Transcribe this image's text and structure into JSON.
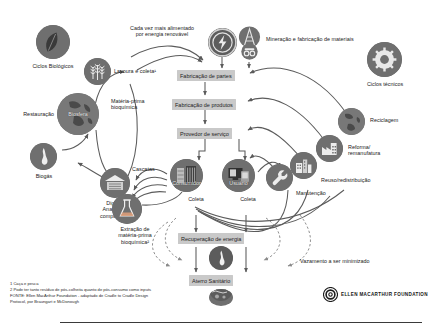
{
  "diagram": {
    "palette": {
      "node_fill": "#6f6f6f",
      "node_fill_dark": "#4f4f4f",
      "box_fill": "#c9c9c9",
      "line": "#5b5b5b",
      "text": "#1c1c1c",
      "background": "#ffffff"
    }
  },
  "annotations": {
    "renewable_energy": "Cada vez mais alimentado\npor energia renovável",
    "mining": "Mineração e fabricação de materiais",
    "farming": "Lavoura e coleta¹",
    "biochem_feedstock": "Matéria-prima\nbioquímica",
    "cascades": "Cascatas",
    "extraction": "Extração de\nmatéria-prima\nbioquímica²",
    "leakage": "Vazamento a ser minimizado"
  },
  "cycles": {
    "biological_label": "Ciclos Biológicos",
    "technical_label": "Ciclos técnicos"
  },
  "left_nodes": [
    {
      "id": "ciclos-biologicos",
      "label": "Ciclos Biológicos",
      "icon": "leaf-icon",
      "inside": ""
    },
    {
      "id": "biosfera",
      "label": "",
      "icon": "globe-icon",
      "inside": "Biosfera"
    },
    {
      "id": "restauracao",
      "label": "Restauração",
      "icon": "",
      "inside": ""
    },
    {
      "id": "biogas",
      "label": "Biogás",
      "icon": "flame-icon",
      "inside": ""
    },
    {
      "id": "digestao",
      "label": "Digestão\nAnaeróbica/\ncompostagem",
      "icon": "compost-icon",
      "inside": ""
    },
    {
      "id": "extracao",
      "label": "Extração de\nmatéria-prima\nbioquímica²",
      "icon": "flask-icon",
      "inside": ""
    },
    {
      "id": "lavoura",
      "label": "Lavoura e coleta¹",
      "icon": "wheat-icon",
      "inside": ""
    }
  ],
  "right_nodes": [
    {
      "id": "ciclos-tecnicos",
      "label": "Ciclos técnicos",
      "icon": "gear-icon"
    },
    {
      "id": "reciclagem",
      "label": "Reciclagem",
      "icon": "recycle-globe-icon"
    },
    {
      "id": "reforma",
      "label": "Reforma/\nremanufatura",
      "icon": "factory-icon"
    },
    {
      "id": "reuso",
      "label": "Reuso/redistribuição",
      "icon": "buildings-icon"
    },
    {
      "id": "manutencao",
      "label": "Manutenção",
      "icon": "wrench-icon"
    }
  ],
  "top_nodes": [
    {
      "id": "energia-renovavel",
      "label": "",
      "icon": "energy-bolt-icon"
    },
    {
      "id": "mineracao",
      "label": "Mineração e fabricação de materiais",
      "icon": "mining-rig-icon"
    }
  ],
  "process_boxes": [
    {
      "id": "fabricacao-partes",
      "label": "Fabricação de partes"
    },
    {
      "id": "fabricacao-produtos",
      "label": "Fabricação de produtos"
    },
    {
      "id": "provedor-servico",
      "label": "Provedor de serviço"
    },
    {
      "id": "recuperacao-energia",
      "label": "Recuperação de energia"
    },
    {
      "id": "aterro-sanitario",
      "label": "Aterro Sanitário"
    }
  ],
  "consumer_nodes": [
    {
      "id": "consumidor",
      "inside": "Consumidor",
      "collect": "Coleta",
      "icon": "shelf-icon"
    },
    {
      "id": "usuario",
      "inside": "Usuário",
      "collect": "Coleta",
      "icon": "monitor-icon"
    }
  ],
  "bottom_nodes": [
    {
      "id": "energia-node",
      "icon": "flame-icon"
    },
    {
      "id": "aterro-node",
      "icon": "landfill-icon"
    }
  ],
  "footnotes": {
    "note1": "1 Caça e pesca",
    "note2": "2 Pode ter tanto resíduo de pós-colheita quanto de pós-consumo como inputs",
    "source_line1": "FONTE: Ellen MacArthur Foundation - adaptado de Cradle to Cradle Design",
    "source_line2": "Protocol, por Braungart e McDonough"
  },
  "logo": {
    "name": "ELLEN MACARTHUR FOUNDATION",
    "mark": "concentric-circle-logo"
  }
}
